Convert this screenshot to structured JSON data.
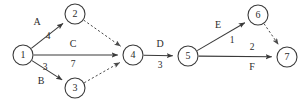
{
  "diagram": {
    "type": "activity-on-edge-network",
    "nodes": [
      {
        "id": "1",
        "label": "1",
        "cx": 23,
        "cy": 55,
        "r": 10
      },
      {
        "id": "2",
        "label": "2",
        "cx": 75,
        "cy": 14,
        "r": 10
      },
      {
        "id": "3",
        "label": "3",
        "cx": 75,
        "cy": 88,
        "r": 10
      },
      {
        "id": "4",
        "label": "4",
        "cx": 133,
        "cy": 55,
        "r": 10
      },
      {
        "id": "5",
        "label": "5",
        "cx": 188,
        "cy": 56,
        "r": 10
      },
      {
        "id": "6",
        "label": "6",
        "cx": 258,
        "cy": 15,
        "r": 10
      },
      {
        "id": "7",
        "label": "7",
        "cx": 287,
        "cy": 57,
        "r": 10
      }
    ],
    "edges": [
      {
        "id": "e-1-2",
        "from": "1",
        "to": "2",
        "style": "solid",
        "activity": "A",
        "weight": "4"
      },
      {
        "id": "e-1-4",
        "from": "1",
        "to": "4",
        "style": "solid",
        "activity": "C",
        "weight": "7"
      },
      {
        "id": "e-1-3",
        "from": "1",
        "to": "3",
        "style": "solid",
        "activity": "B",
        "weight": "3"
      },
      {
        "id": "e-2-4",
        "from": "2",
        "to": "4",
        "style": "dashed",
        "activity": "",
        "weight": ""
      },
      {
        "id": "e-3-4",
        "from": "3",
        "to": "4",
        "style": "dashed",
        "activity": "",
        "weight": ""
      },
      {
        "id": "e-4-5",
        "from": "4",
        "to": "5",
        "style": "solid",
        "activity": "D",
        "weight": "3"
      },
      {
        "id": "e-5-6",
        "from": "5",
        "to": "6",
        "style": "solid",
        "activity": "E",
        "weight": "1"
      },
      {
        "id": "e-5-7",
        "from": "5",
        "to": "7",
        "style": "solid",
        "activity": "F",
        "weight": "2"
      },
      {
        "id": "e-6-7",
        "from": "6",
        "to": "7",
        "style": "dashed",
        "activity": "",
        "weight": ""
      }
    ],
    "labels": [
      {
        "id": "lbl-A",
        "text": "A",
        "x": 37,
        "y": 23,
        "kind": "activity"
      },
      {
        "id": "lbl-4",
        "text": "4",
        "x": 48,
        "y": 37,
        "kind": "weight"
      },
      {
        "id": "lbl-C",
        "text": "C",
        "x": 73,
        "y": 45,
        "kind": "activity"
      },
      {
        "id": "lbl-7",
        "text": "7",
        "x": 73,
        "y": 65,
        "kind": "weight"
      },
      {
        "id": "lbl-3a",
        "text": "3",
        "x": 45,
        "y": 68,
        "kind": "weight"
      },
      {
        "id": "lbl-B",
        "text": "B",
        "x": 41,
        "y": 82,
        "kind": "activity"
      },
      {
        "id": "lbl-D",
        "text": "D",
        "x": 160,
        "y": 45,
        "kind": "activity"
      },
      {
        "id": "lbl-3b",
        "text": "3",
        "x": 160,
        "y": 66,
        "kind": "weight"
      },
      {
        "id": "lbl-E",
        "text": "E",
        "x": 218,
        "y": 26,
        "kind": "activity"
      },
      {
        "id": "lbl-1",
        "text": "1",
        "x": 232,
        "y": 41,
        "kind": "weight"
      },
      {
        "id": "lbl-2",
        "text": "2",
        "x": 252,
        "y": 48,
        "kind": "weight"
      },
      {
        "id": "lbl-F",
        "text": "F",
        "x": 252,
        "y": 68,
        "kind": "activity"
      }
    ],
    "colors": {
      "stroke": "#3a3a3a",
      "dashed_stroke": "#4a4a4a",
      "text": "#2b2b2b",
      "background": "#ffffff"
    }
  }
}
